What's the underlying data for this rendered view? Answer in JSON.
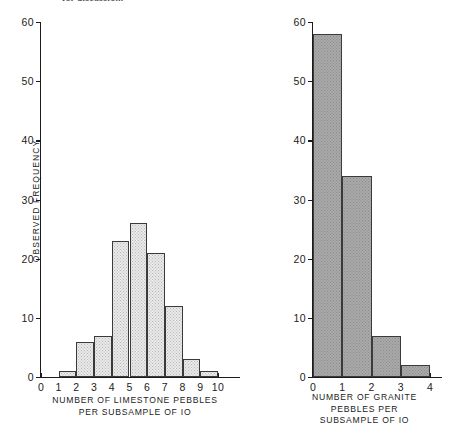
{
  "page": {
    "header_fragment": "for discussion."
  },
  "chart_data": [
    {
      "id": "limestone",
      "type": "bar",
      "title": "",
      "xlabel": "NUMBER OF LIMESTONE  PEBBLES\nPER SUBSAMPLE OF IO",
      "xlabel_lines": [
        "NUMBER OF LIMESTONE  PEBBLES",
        "PER SUBSAMPLE OF IO"
      ],
      "ylabel": "OBSERVED FREQUENCY",
      "categories": [
        "0",
        "1",
        "2",
        "3",
        "4",
        "5",
        "6",
        "7",
        "8",
        "9",
        "10"
      ],
      "values": [
        0,
        1,
        6,
        7,
        23,
        26,
        21,
        12,
        3,
        1,
        0
      ],
      "xlim": [
        0,
        10
      ],
      "ylim": [
        0,
        60
      ],
      "yticks": [
        0,
        10,
        20,
        30,
        40,
        50,
        60
      ],
      "ytick_labels": [
        "0",
        "10",
        "20",
        "30",
        "40",
        "50",
        "60"
      ],
      "xticks": [
        0,
        1,
        2,
        3,
        4,
        5,
        6,
        7,
        8,
        9,
        10
      ],
      "xtick_labels": [
        "0",
        "1",
        "2",
        "3",
        "4",
        "5",
        "6",
        "7",
        "8",
        "9",
        "10"
      ],
      "grid": false,
      "legend": "none",
      "bar_style": "light-stipple"
    },
    {
      "id": "granite",
      "type": "bar",
      "title": "",
      "xlabel": "NUMBER OF GRANITE\nPEBBLES  PER\nSUBSAMPLE  OF IO",
      "xlabel_lines": [
        "NUMBER OF GRANITE",
        "PEBBLES  PER",
        "SUBSAMPLE  OF IO"
      ],
      "ylabel": "",
      "categories": [
        "0",
        "1",
        "2",
        "3",
        "4"
      ],
      "values": [
        58,
        34,
        7,
        2,
        0
      ],
      "xlim": [
        0,
        4
      ],
      "ylim": [
        0,
        60
      ],
      "yticks": [
        0,
        10,
        20,
        30,
        40,
        50,
        60
      ],
      "ytick_labels": [
        "0",
        "10",
        "20",
        "30",
        "40",
        "50",
        "60"
      ],
      "xticks": [
        0,
        1,
        2,
        3,
        4
      ],
      "xtick_labels": [
        "0",
        "1",
        "2",
        "3",
        "4"
      ],
      "grid": false,
      "legend": "none",
      "bar_style": "dark-stipple"
    }
  ],
  "colors": {
    "axis": "#1c1c1c",
    "bar_light_fill": "#e9e9e9",
    "bar_dark_fill": "#a9a9a9",
    "bar_outline": "#3a3a3a",
    "background": "#ffffff"
  }
}
